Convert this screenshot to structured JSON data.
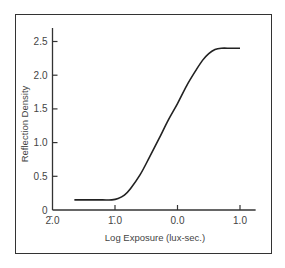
{
  "chart_data": {
    "type": "line",
    "title": "",
    "xlabel": "Log Exposure (lux-sec.)",
    "ylabel": "Reflection Density",
    "x_ticks": [
      {
        "value": -2.0,
        "label": "2̄.0"
      },
      {
        "value": -1.0,
        "label": "1̄.0"
      },
      {
        "value": 0.0,
        "label": "0.0"
      },
      {
        "value": 1.0,
        "label": "1.0"
      }
    ],
    "y_ticks": [
      {
        "value": 0,
        "label": "0"
      },
      {
        "value": 0.5,
        "label": "0.5"
      },
      {
        "value": 1.0,
        "label": "1.0"
      },
      {
        "value": 1.5,
        "label": "1.5"
      },
      {
        "value": 2.0,
        "label": "2.0"
      },
      {
        "value": 2.5,
        "label": "2.5"
      }
    ],
    "xlim": [
      -2.0,
      1.25
    ],
    "ylim": [
      0,
      2.7
    ],
    "grid": false,
    "legend": null,
    "series": [
      {
        "name": "Characteristic curve",
        "x": [
          -1.65,
          -1.4,
          -1.2,
          -1.05,
          -0.95,
          -0.85,
          -0.75,
          -0.6,
          -0.45,
          -0.3,
          -0.15,
          0.0,
          0.15,
          0.3,
          0.4,
          0.5,
          0.6,
          0.7,
          0.85,
          1.0
        ],
        "y": [
          0.15,
          0.15,
          0.15,
          0.15,
          0.17,
          0.22,
          0.32,
          0.52,
          0.78,
          1.05,
          1.33,
          1.58,
          1.85,
          2.08,
          2.22,
          2.32,
          2.38,
          2.4,
          2.4,
          2.4
        ]
      }
    ]
  },
  "labels": {
    "xlabel": "Log Exposure (lux-sec.)",
    "ylabel": "Reflection Density"
  }
}
